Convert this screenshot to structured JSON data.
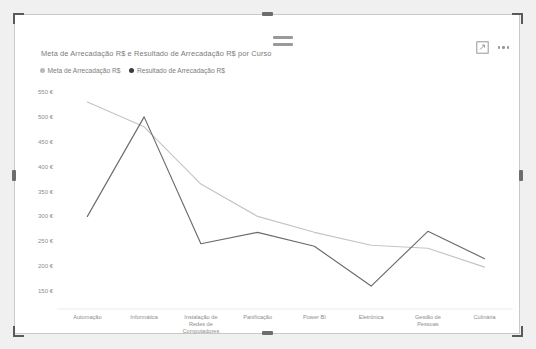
{
  "visual": {
    "title": "Meta de Arrecadação R$ e Resultado de Arrecadação R$ por Curso",
    "drag_handle_name": "drag-handle",
    "actions": {
      "focus_mode_label": "Focus mode",
      "more_options_label": "More options"
    },
    "colors": {
      "meta": "#c4c4c4",
      "resultado": "#6b6b6b",
      "background": "#ffffff",
      "border": "#c9c9c9",
      "axis_text": "#8d8d8d",
      "title_text": "#7b7b7b"
    }
  },
  "chart_data": {
    "type": "line",
    "title": "Meta de Arrecadação R$ e Resultado de Arrecadação R$ por Curso",
    "xlabel": "Curso",
    "ylabel": "",
    "grid": false,
    "legend_position": "top-left",
    "categories": [
      "Automação",
      "Informática",
      "Instalação de Redes de Computadores",
      "Panificação",
      "Power BI",
      "Eletrônica",
      "Gestão de Pessoas",
      "Culinária"
    ],
    "yticks": [
      "550 €",
      "500 €",
      "450 €",
      "400 €",
      "350 €",
      "300 €",
      "250 €",
      "200 €",
      "150 €"
    ],
    "ytick_values": [
      550,
      500,
      450,
      400,
      350,
      300,
      250,
      200,
      150
    ],
    "ylim": [
      130,
      560
    ],
    "series": [
      {
        "name": "Meta de Arrecadação R$",
        "color": "#c4c4c4",
        "values": [
          530,
          480,
          365,
          300,
          268,
          242,
          236,
          198
        ]
      },
      {
        "name": "Resultado de Arrecadação R$",
        "color": "#6b6b6b",
        "values": [
          300,
          500,
          245,
          268,
          240,
          160,
          270,
          215
        ]
      }
    ]
  }
}
